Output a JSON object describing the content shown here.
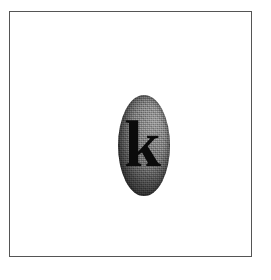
{
  "canvas": {
    "width": 271,
    "height": 280,
    "background_color": "#ffffff"
  },
  "frame": {
    "border_color": "#555555",
    "fill_color": "#ffffff"
  },
  "badge": {
    "shape": "ellipse",
    "letter": "k",
    "letter_case": "lowercase",
    "letter_color": "#0b0b0b",
    "letter_style": "bold serif",
    "fill_light_color": "#949494",
    "fill_mid_color": "#757575",
    "fill_dark_color": "#575757",
    "texture": "grainy"
  }
}
